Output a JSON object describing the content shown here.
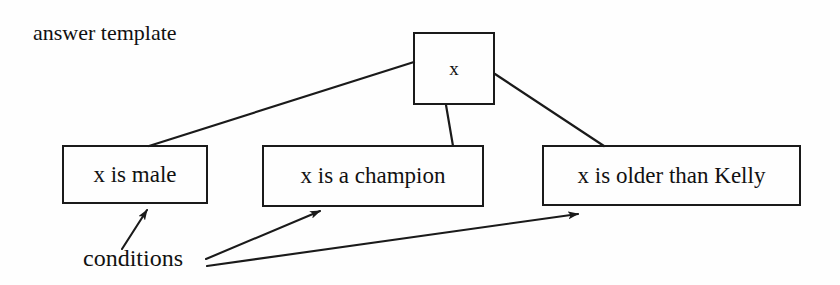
{
  "diagram": {
    "caption_top": "answer template",
    "caption_bottom": "conditions",
    "root_node": {
      "label": "x"
    },
    "condition_nodes": [
      {
        "label": "x is male"
      },
      {
        "label": "x is a champion"
      },
      {
        "label": "x is older than Kelly"
      }
    ],
    "colors": {
      "stroke": "#1a1a1a",
      "text": "#111111",
      "background": "#ffffff"
    }
  }
}
